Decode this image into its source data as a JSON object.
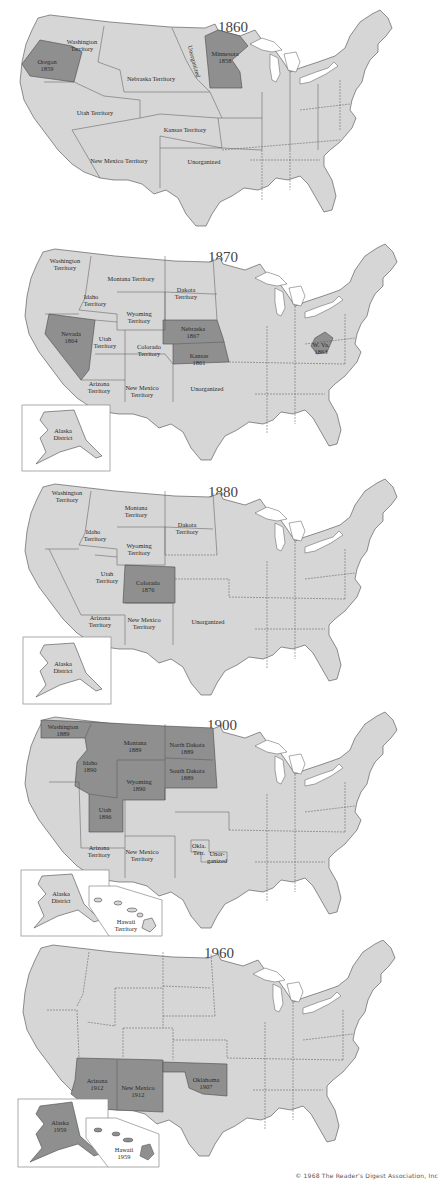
{
  "colors": {
    "land": "#d6d6d6",
    "admitted_state": "#8f8f8f",
    "border": "#4a4a4a",
    "water": "#ffffff"
  },
  "panels": [
    {
      "year": "1860",
      "highlighted": [
        {
          "name": "Oregon",
          "year": "1859"
        },
        {
          "name": "Minnesota",
          "year": "1858"
        }
      ],
      "labels": {
        "washington": "Washington",
        "washington2": "Territory",
        "oregon": "Oregon",
        "oregon_year": "1859",
        "nebraska": "Nebraska Territory",
        "unorganized_north": "Unorganized",
        "minnesota": "Minnesota",
        "minnesota_year": "1858",
        "utah": "Utah Territory",
        "kansas": "Kansas Territory",
        "new_mexico": "New Mexico Territory",
        "unorganized": "Unorganized"
      }
    },
    {
      "year": "1870",
      "highlighted": [
        {
          "name": "Nevada",
          "year": "1864"
        },
        {
          "name": "Nebraska",
          "year": "1867"
        },
        {
          "name": "Kansas",
          "year": "1861"
        },
        {
          "name": "W. Va.",
          "year": "1863"
        }
      ],
      "labels": {
        "washington": "Washington",
        "washington2": "Territory",
        "montana": "Montana Territory",
        "dakota": "Dakota",
        "dakota2": "Territory",
        "idaho": "Idaho",
        "idaho2": "Territory",
        "wyoming": "Wyoming",
        "wyoming2": "Territory",
        "nevada": "Nevada",
        "nevada_year": "1864",
        "utah": "Utah",
        "utah2": "Territory",
        "colorado": "Colorado",
        "colorado2": "Territory",
        "nebraska": "Nebraska",
        "nebraska_year": "1867",
        "kansas": "Kansas",
        "kansas_year": "1861",
        "wva": "W. Va.",
        "wva_year": "1863",
        "arizona": "Arizona",
        "arizona2": "Territory",
        "new_mexico": "New Mexico",
        "new_mexico2": "Territory",
        "unorganized": "Unorganized",
        "alaska": "Alaska",
        "alaska2": "District"
      }
    },
    {
      "year": "1880",
      "highlighted": [
        {
          "name": "Colorado",
          "year": "1876"
        }
      ],
      "labels": {
        "washington": "Washington",
        "washington2": "Territory",
        "montana": "Montana",
        "montana2": "Territory",
        "dakota": "Dakota",
        "dakota2": "Territory",
        "idaho": "Idaho",
        "idaho2": "Territory",
        "wyoming": "Wyoming",
        "wyoming2": "Territory",
        "utah": "Utah",
        "utah2": "Territory",
        "colorado": "Colorado",
        "colorado_year": "1876",
        "arizona": "Arizona",
        "arizona2": "Territory",
        "new_mexico": "New Mexico",
        "new_mexico2": "Territory",
        "unorganized": "Unorganized",
        "alaska": "Alaska",
        "alaska2": "District"
      }
    },
    {
      "year": "1900",
      "highlighted": [
        {
          "name": "Washington",
          "year": "1889"
        },
        {
          "name": "Montana",
          "year": "1889"
        },
        {
          "name": "North Dakota",
          "year": "1889"
        },
        {
          "name": "South Dakota",
          "year": "1889"
        },
        {
          "name": "Idaho",
          "year": "1890"
        },
        {
          "name": "Wyoming",
          "year": "1890"
        },
        {
          "name": "Utah",
          "year": "1896"
        }
      ],
      "labels": {
        "washington": "Washington",
        "washington_year": "1889",
        "montana": "Montana",
        "montana_year": "1889",
        "north_dakota": "North Dakota",
        "north_dakota_year": "1889",
        "idaho": "Idaho",
        "idaho_year": "1890",
        "south_dakota": "South Dakota",
        "south_dakota_year": "1889",
        "wyoming": "Wyoming",
        "wyoming_year": "1890",
        "utah": "Utah",
        "utah_year": "1896",
        "arizona": "Arizona",
        "arizona2": "Territory",
        "new_mexico": "New Mexico",
        "new_mexico2": "Territory",
        "okla": "Okla.",
        "okla2": "Terr.",
        "unorganized": "Unor-",
        "unorganized2": "ganized",
        "alaska": "Alaska",
        "alaska2": "District",
        "hawaii": "Hawaii",
        "hawaii2": "Territory"
      }
    },
    {
      "year": "1960",
      "highlighted": [
        {
          "name": "Arizona",
          "year": "1912"
        },
        {
          "name": "New Mexico",
          "year": "1912"
        },
        {
          "name": "Oklahoma",
          "year": "1907"
        },
        {
          "name": "Alaska",
          "year": "1959"
        },
        {
          "name": "Hawaii",
          "year": "1959"
        }
      ],
      "labels": {
        "arizona": "Arizona",
        "arizona_year": "1912",
        "new_mexico": "New Mexico",
        "new_mexico_year": "1912",
        "oklahoma": "Oklahoma",
        "oklahoma_year": "1907",
        "alaska": "Alaska",
        "alaska_year": "1959",
        "hawaii": "Hawaii",
        "hawaii_year": "1959"
      }
    }
  ],
  "footer": {
    "copyright": "© 1968 The Reader's Digest Association, Inc"
  }
}
